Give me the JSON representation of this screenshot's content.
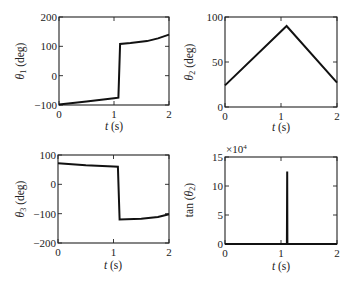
{
  "chart_data": [
    {
      "type": "line",
      "id": "theta1",
      "title": "",
      "xlabel": "t (s)",
      "ylabel": "θ1 (deg)",
      "xlim": [
        0,
        2
      ],
      "ylim": [
        -100,
        200
      ],
      "xticks": [
        0,
        1,
        2
      ],
      "yticks": [
        -100,
        0,
        100,
        200
      ],
      "ytick_labels": [
        "−100",
        "0",
        "100",
        "200"
      ],
      "grid": false,
      "box": [
        59,
        17,
        169,
        105
      ],
      "series": [
        {
          "name": "theta1",
          "x": [
            0,
            0.5,
            1.0,
            1.08,
            1.11,
            1.3,
            1.6,
            1.8,
            2.0
          ],
          "y": [
            -98,
            -88,
            -77,
            -75,
            108,
            111,
            118,
            127,
            140
          ]
        }
      ]
    },
    {
      "type": "line",
      "id": "theta2",
      "title": "",
      "xlabel": "t (s)",
      "ylabel": "θ2 (deg)",
      "xlim": [
        0,
        2
      ],
      "ylim": [
        0,
        100
      ],
      "xticks": [
        0,
        1,
        2
      ],
      "yticks": [
        0,
        50,
        100
      ],
      "ytick_labels": [
        "0",
        "50",
        "100"
      ],
      "grid": false,
      "box": [
        225,
        17,
        337,
        107
      ],
      "series": [
        {
          "name": "theta2",
          "x": [
            0,
            1.1,
            2.0
          ],
          "y": [
            24,
            90,
            27
          ]
        }
      ]
    },
    {
      "type": "line",
      "id": "theta3",
      "title": "",
      "xlabel": "t (s)",
      "ylabel": "θ3 (deg)",
      "xlim": [
        0,
        2
      ],
      "ylim": [
        -200,
        100
      ],
      "xticks": [
        0,
        1,
        2
      ],
      "yticks": [
        -200,
        -100,
        0,
        100
      ],
      "ytick_labels": [
        "−200",
        "−100",
        "0",
        "100"
      ],
      "grid": false,
      "box": [
        58,
        155,
        169,
        243
      ],
      "series": [
        {
          "name": "theta3",
          "x": [
            0,
            0.5,
            1.0,
            1.08,
            1.11,
            1.5,
            1.8,
            2.0
          ],
          "y": [
            72,
            65,
            61,
            60,
            -120,
            -117,
            -111,
            -102
          ]
        }
      ]
    },
    {
      "type": "line",
      "id": "tan_theta2",
      "title": "",
      "xlabel": "t (s)",
      "ylabel": "tan(θ2)",
      "multiplier": "×10^4",
      "xlim": [
        0,
        2
      ],
      "ylim": [
        0,
        15
      ],
      "xticks": [
        0,
        1,
        2
      ],
      "yticks": [
        0,
        5,
        10,
        15
      ],
      "ytick_labels": [
        "0",
        "5",
        "10",
        "15"
      ],
      "grid": false,
      "box": [
        225,
        157,
        337,
        244
      ],
      "series": [
        {
          "name": "tan_theta2",
          "x": [
            0,
            1.105,
            1.11,
            1.115,
            2.0
          ],
          "y": [
            0,
            0,
            12.5,
            0,
            0
          ]
        }
      ]
    }
  ],
  "labels": {
    "p1": {
      "ylab_sym": "θ",
      "ylab_sub": "1",
      "ylab_unit": " (deg)",
      "xlab_var": "t",
      "xlab_unit": " (s)"
    },
    "p2": {
      "ylab_sym": "θ",
      "ylab_sub": "2",
      "ylab_unit": " (deg)",
      "xlab_var": "t",
      "xlab_unit": " (s)"
    },
    "p3": {
      "ylab_sym": "θ",
      "ylab_sub": "3",
      "ylab_unit": " (deg)",
      "xlab_var": "t",
      "xlab_unit": " (s)"
    },
    "p4": {
      "ylab_pre": "tan (",
      "ylab_sym": "θ",
      "ylab_sub": "2",
      "ylab_post": ")",
      "xlab_var": "t",
      "xlab_unit": " (s)",
      "mult_base": "×10",
      "mult_exp": "4"
    }
  }
}
